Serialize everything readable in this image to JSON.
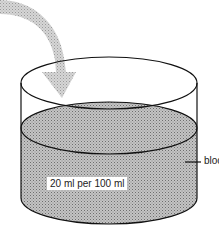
{
  "diagram": {
    "title": "",
    "elements": {
      "arrow": {
        "description": "curved grey arrow pointing down into container",
        "color": "#b8b8b8"
      },
      "container": {
        "description": "open-top cylindrical beaker",
        "stroke": "#111111"
      },
      "liquid": {
        "description": "hatched grey liquid filling lower part",
        "fill": "#a9a9a9"
      }
    },
    "labels": {
      "concentration": "20 ml per 100 ml",
      "liquid_name": "blood"
    }
  }
}
